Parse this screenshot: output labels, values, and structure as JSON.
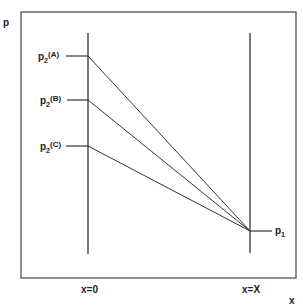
{
  "diagram": {
    "axes": {
      "y_label": "p",
      "x_label": "x"
    },
    "boundaries": [
      {
        "id": "left",
        "label": "x=0"
      },
      {
        "id": "right",
        "label": "x=X"
      }
    ],
    "left_pressures": [
      {
        "base": "p",
        "sub": "2",
        "sup": "(A)"
      },
      {
        "base": "p",
        "sub": "2",
        "sup": "(B)"
      },
      {
        "base": "p",
        "sub": "2",
        "sup": "(C)"
      }
    ],
    "right_pressure": {
      "base": "p",
      "sub": "1"
    },
    "line_color": "#333333"
  }
}
